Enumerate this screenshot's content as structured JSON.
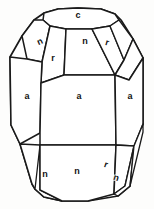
{
  "figure": {
    "kind": "crystal-form-diagram",
    "line_color": "#1a1a1a",
    "fill_color": "#ffffff",
    "background_color": "#fdfdfc",
    "width": 154,
    "height": 209
  },
  "faces": {
    "top_c": {
      "label": "c",
      "x": 78,
      "y": 16,
      "rotate": 0
    },
    "upper_left_n": {
      "label": "n",
      "x": 40,
      "y": 42,
      "rotate": -24
    },
    "upper_left_r": {
      "label": "r",
      "x": 53,
      "y": 59,
      "rotate": 0
    },
    "upper_mid_n": {
      "label": "n",
      "x": 85,
      "y": 42,
      "rotate": 0
    },
    "upper_right_r": {
      "label": "r",
      "x": 107,
      "y": 43,
      "rotate": 16
    },
    "left_a": {
      "label": "a",
      "x": 27,
      "y": 97,
      "rotate": 0
    },
    "center_a": {
      "label": "a",
      "x": 79,
      "y": 97,
      "rotate": 0
    },
    "right_a": {
      "label": "a",
      "x": 130,
      "y": 97,
      "rotate": 0
    },
    "lower_left_n": {
      "label": "n",
      "x": 45,
      "y": 175,
      "rotate": 0
    },
    "lower_mid_n": {
      "label": "n",
      "x": 77,
      "y": 172,
      "rotate": 0
    },
    "lower_right_r": {
      "label": "r",
      "x": 106,
      "y": 165,
      "rotate": 18
    },
    "lower_right_n": {
      "label": "n",
      "x": 116,
      "y": 178,
      "rotate": 18
    }
  },
  "geometry": {
    "outline": "M 78,8 L 101,9 L 115,14 L 121,20 L 133,39 L 143,58 L 143,124 L 134,146 L 130,186 L 118,196 L 88,201 L 62,201 L 44,197 L 35,189 L 32,184 L 20,144 L 11,125 L 10,57 L 22,36 L 34,20 L 44,13 L 58,9 Z",
    "top_face_c": "M 78,8 L 101,9 L 115,14 L 119,20 L 110,26 L 92,29 L 66,29 L 50,26 L 43,20 L 44,13 L 58,9 Z",
    "upper_left_n": "M 43,20 L 50,26 L 42,62 L 27,59 L 22,36 L 34,20 Z",
    "upper_left_r": "M 50,26 L 66,29 L 64,75 L 41,83 L 42,62 Z",
    "upper_mid_n": "M 66,29 L 92,29 L 115,75 L 64,75 Z",
    "upper_right_r": "M 92,29 L 110,26 L 124,60 L 115,75 Z",
    "upper_right_n_sliver": "M 110,26 L 119,20 L 133,39 L 124,60 Z",
    "upper_far_right": "M 124,60 L 133,39 L 143,58 L 129,80 L 115,75 Z",
    "left_a": "M 27,59 L 42,62 L 41,83 L 40,133 L 20,144 L 11,125 L 10,57 Z",
    "center_a": "M 64,75 L 115,75 L 116,145 L 40,145 L 40,133 L 41,83 Z",
    "right_a": "M 115,75 L 129,80 L 143,58 L 143,124 L 134,146 L 116,145 Z",
    "lower_left_n": "M 20,144 L 40,145 L 40,190 L 35,189 L 32,184 Z",
    "lower_left_edge": "M 40,145 L 40,190 L 62,201 L 44,197 L 35,189 Z",
    "lower_mid_n": "M 40,145 L 116,145 L 114,194 L 88,201 L 62,201 L 40,190 Z",
    "lower_right_r": "M 116,145 L 134,146 L 125,186 L 114,194 Z",
    "lower_right_n": "M 125,186 L 134,146 L 130,186 L 118,196 L 114,194 Z",
    "lower_right_far": "M 134,146 L 143,124 L 143,132 L 130,186 Z"
  }
}
